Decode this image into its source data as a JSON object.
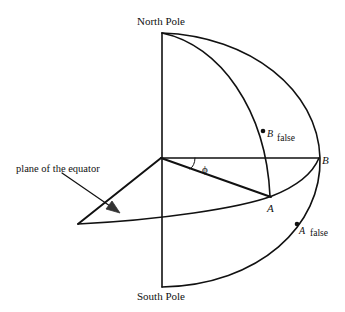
{
  "labels": {
    "north_pole": "North Pole",
    "south_pole": "South Pole",
    "plane_of_equator": "plane of the equator",
    "angle": "ϕ",
    "point_a": "A",
    "point_b": "B",
    "point_a_false": "A",
    "point_b_false": "B",
    "false_suffix_a": "false",
    "false_suffix_b": "false"
  },
  "colors": {
    "stroke": "#111111",
    "background": "#ffffff"
  }
}
